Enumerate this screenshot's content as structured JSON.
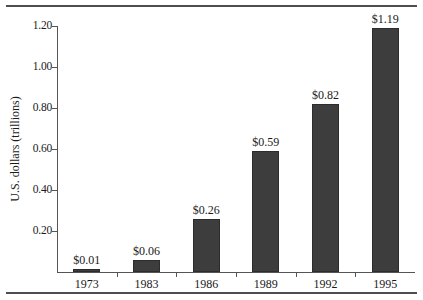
{
  "chart_data": {
    "type": "bar",
    "title": "",
    "xlabel": "",
    "ylabel": "U.S. dollars (trillions)",
    "categories": [
      "1973",
      "1983",
      "1986",
      "1989",
      "1992",
      "1995"
    ],
    "values": [
      0.01,
      0.06,
      0.26,
      0.59,
      0.82,
      1.19
    ],
    "value_labels": [
      "$0.01",
      "$0.06",
      "$0.26",
      "$0.59",
      "$0.82",
      "$1.19"
    ],
    "ylim": [
      0,
      1.2
    ],
    "ytick_values": [
      0.2,
      0.4,
      0.6,
      0.8,
      1.0,
      1.2
    ],
    "ytick_labels": [
      "0.20",
      "0.40",
      "0.60",
      "0.80",
      "1.00",
      "1.20"
    ],
    "grid": false,
    "legend": "none",
    "bar_color": "#3d3d3d",
    "axis_color": "#555555",
    "rule_color": "#4d4d4d",
    "text_color": "#1a1a1a"
  }
}
